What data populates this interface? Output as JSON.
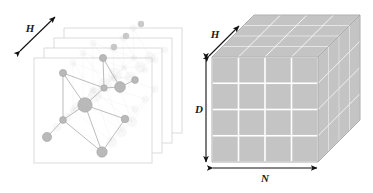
{
  "figure": {
    "background_color": "#ffffff",
    "panels": {
      "title": "graph-layer-stack",
      "label_h": "H",
      "layer_count": 4,
      "layer_border_color": "#d8d8d8",
      "layer_fill_color": "#ffffff",
      "front_layer": {
        "x": 34,
        "y": 58,
        "width": 118,
        "height": 105
      },
      "layer_offset": {
        "dx": 10,
        "dy": -10
      },
      "back_layer_node_color": "#c9c9c9",
      "back_layer_nodes": [
        {
          "layer": 3,
          "cx": 141,
          "cy": 24,
          "r": 3.2
        },
        {
          "layer": 2,
          "cx": 126,
          "cy": 36,
          "r": 3.2
        },
        {
          "layer": 1,
          "cx": 114,
          "cy": 47,
          "r": 3.2
        }
      ],
      "graph": {
        "node_color": "#b9b9b9",
        "node_stroke": "#a3a3a3",
        "edge_color": "#b0b0b0",
        "nodes": [
          {
            "id": "n1",
            "cx": 103,
            "cy": 58,
            "r": 3.6
          },
          {
            "id": "n2",
            "cx": 63,
            "cy": 73,
            "r": 3.6
          },
          {
            "id": "n3",
            "cx": 104,
            "cy": 88,
            "r": 3.2
          },
          {
            "id": "n4",
            "cx": 120,
            "cy": 87,
            "r": 5.4
          },
          {
            "id": "n5",
            "cx": 135,
            "cy": 80,
            "r": 3.4
          },
          {
            "id": "n6",
            "cx": 85,
            "cy": 105,
            "r": 7.2
          },
          {
            "id": "n7",
            "cx": 63,
            "cy": 120,
            "r": 3.4
          },
          {
            "id": "n8",
            "cx": 125,
            "cy": 119,
            "r": 3.8
          },
          {
            "id": "n9",
            "cx": 47,
            "cy": 137,
            "r": 4.6
          },
          {
            "id": "n10",
            "cx": 102,
            "cy": 152,
            "r": 5.2
          }
        ],
        "edges": [
          [
            "n1",
            "n3"
          ],
          [
            "n1",
            "n4"
          ],
          [
            "n2",
            "n3"
          ],
          [
            "n2",
            "n6"
          ],
          [
            "n2",
            "n7"
          ],
          [
            "n3",
            "n4"
          ],
          [
            "n4",
            "n5"
          ],
          [
            "n6",
            "n3"
          ],
          [
            "n6",
            "n7"
          ],
          [
            "n6",
            "n8"
          ],
          [
            "n6",
            "n10"
          ],
          [
            "n7",
            "n9"
          ],
          [
            "n7",
            "n10"
          ],
          [
            "n8",
            "n10"
          ]
        ]
      }
    },
    "cube": {
      "title": "tensor-cube",
      "label_h": "H",
      "label_d": "D",
      "label_n": "N",
      "divisions": 4,
      "cell_fill_color": "#c4c4c4",
      "cell_gap_color": "#ffffff",
      "outline_color": "#9a9a9a",
      "arrow_color": "#111111",
      "front_face": {
        "x": 212,
        "y": 57,
        "width": 106,
        "height": 105
      },
      "depth_offset": {
        "dx": 42,
        "dy": -42
      }
    }
  }
}
